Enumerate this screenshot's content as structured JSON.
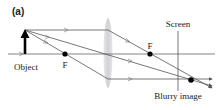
{
  "figure": {
    "panel_label": "(a)",
    "labels": {
      "object": "Object",
      "focal_left": "F",
      "focal_right": "F",
      "screen": "Screen",
      "blurry_image": "Blurry image"
    },
    "colors": {
      "ray": "#555555",
      "axis": "#666666",
      "lens": "#d9d9dc",
      "object_arrow": "#000000",
      "point": "#000000"
    }
  }
}
